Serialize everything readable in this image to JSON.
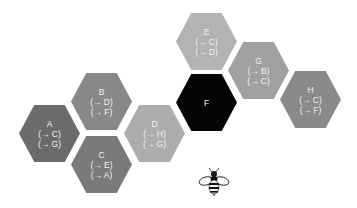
{
  "nodes": [
    {
      "id": "A",
      "label": "A",
      "edges": [
        "(→ C)",
        "(→ G)"
      ],
      "color": "#6b6b6b",
      "x": 19,
      "y": 105
    },
    {
      "id": "B",
      "label": "B",
      "edges": [
        "(→ D)",
        "(→ F)"
      ],
      "color": "#888888",
      "x": 71,
      "y": 73
    },
    {
      "id": "C",
      "label": "C",
      "edges": [
        "(→ E)",
        "(→ A)"
      ],
      "color": "#7a7a7a",
      "x": 71,
      "y": 136
    },
    {
      "id": "D",
      "label": "D",
      "edges": [
        "(→ H)",
        "(→ G)"
      ],
      "color": "#adadad",
      "x": 124,
      "y": 105
    },
    {
      "id": "E",
      "label": "E",
      "edges": [
        "(→ C)",
        "(→ D)"
      ],
      "color": "#b3b3b3",
      "x": 176,
      "y": 13
    },
    {
      "id": "F",
      "label": "F",
      "edges": [],
      "color": "#050505",
      "x": 176,
      "y": 74
    },
    {
      "id": "G",
      "label": "G",
      "edges": [
        "(→ B)",
        "(→ C)"
      ],
      "color": "#a0a0a0",
      "x": 228,
      "y": 42
    },
    {
      "id": "H",
      "label": "H",
      "edges": [
        "(→ C)",
        "(→ F)"
      ],
      "color": "#8a8a8a",
      "x": 280,
      "y": 71
    }
  ],
  "bee": {
    "icon": "bee-icon"
  }
}
